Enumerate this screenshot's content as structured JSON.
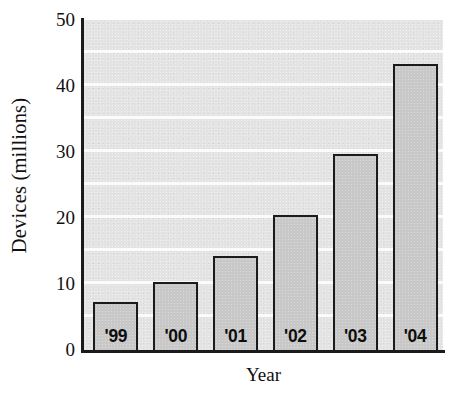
{
  "chart_data": {
    "type": "bar",
    "title": "",
    "xlabel": "Year",
    "ylabel": "Devices (millions)",
    "categories": [
      "'99",
      "'00",
      "'01",
      "'02",
      "'03",
      "'04"
    ],
    "values": [
      7.3,
      10.3,
      14.3,
      20.5,
      29.7,
      43.3
    ],
    "ylim": [
      0,
      50
    ],
    "yticks": [
      "0",
      "10",
      "20",
      "30",
      "40",
      "50"
    ],
    "ytick_values": [
      0,
      10,
      20,
      30,
      40,
      50
    ],
    "gridline_values": [
      5,
      10,
      15,
      20,
      25,
      30,
      35,
      40,
      45
    ],
    "grid": true,
    "legend": "none",
    "colors": {
      "plot_background": "#e3e3e3",
      "bar_fill": "#c8c8c8",
      "bar_outline": "#1b1b1b",
      "gridline": "#fbfbfb",
      "axis": "#1b1b1b",
      "text": "#111111"
    }
  }
}
